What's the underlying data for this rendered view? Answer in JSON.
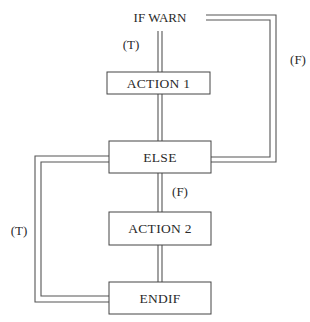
{
  "diagram": {
    "type": "flowchart",
    "start": {
      "label": "IF WARN"
    },
    "nodes": [
      {
        "id": "action1",
        "label": "ACTION 1"
      },
      {
        "id": "else",
        "label": "ELSE"
      },
      {
        "id": "action2",
        "label": "ACTION 2"
      },
      {
        "id": "endif",
        "label": "ENDIF"
      }
    ],
    "edges": [
      {
        "from": "start",
        "to": "action1",
        "label": "(T)"
      },
      {
        "from": "start",
        "to": "else",
        "label": "(F)"
      },
      {
        "from": "action1",
        "to": "else",
        "label": ""
      },
      {
        "from": "else",
        "to": "action2",
        "label": "(F)"
      },
      {
        "from": "else",
        "to": "endif",
        "label": "(T)"
      },
      {
        "from": "action2",
        "to": "endif",
        "label": ""
      }
    ],
    "colors": {
      "line": "#555555",
      "text": "#2a2a2a",
      "background": "#ffffff"
    }
  }
}
